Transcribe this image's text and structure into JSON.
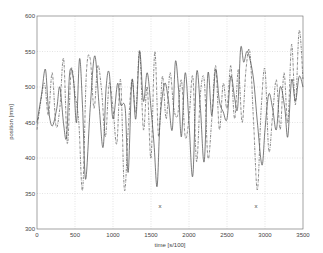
{
  "chart_data": {
    "type": "line",
    "title": "",
    "xlabel": "time [s/100]",
    "ylabel": "position [mm]",
    "xlim": [
      0,
      3500
    ],
    "ylim": [
      300,
      600
    ],
    "xticks": [
      0,
      500,
      1000,
      1500,
      2000,
      2500,
      3000,
      3500
    ],
    "yticks": [
      300,
      350,
      400,
      450,
      500,
      550,
      600
    ],
    "grid": true,
    "legend": null,
    "series": [
      {
        "name": "solid",
        "style": "solid",
        "color": "#444444",
        "x": [
          0,
          60,
          110,
          150,
          200,
          260,
          300,
          350,
          390,
          430,
          480,
          520,
          560,
          600,
          640,
          700,
          760,
          820,
          870,
          910,
          950,
          1000,
          1060,
          1100,
          1160,
          1200,
          1250,
          1300,
          1350,
          1400,
          1450,
          1500,
          1540,
          1580,
          1620,
          1680,
          1730,
          1780,
          1820,
          1860,
          1900,
          1950,
          2000,
          2050,
          2100,
          2150,
          2200,
          2250,
          2300,
          2350,
          2400,
          2450,
          2500,
          2550,
          2600,
          2640,
          2680,
          2720,
          2760,
          2800,
          2850,
          2900,
          2960,
          3000,
          3050,
          3100,
          3150,
          3200,
          3260,
          3300,
          3350,
          3400,
          3450,
          3500
        ],
        "y": [
          450,
          490,
          525,
          470,
          445,
          470,
          500,
          448,
          430,
          520,
          510,
          450,
          540,
          470,
          370,
          470,
          544,
          470,
          415,
          500,
          520,
          455,
          505,
          475,
          470,
          380,
          510,
          455,
          550,
          480,
          520,
          470,
          420,
          360,
          455,
          505,
          480,
          440,
          535,
          500,
          430,
          520,
          450,
          375,
          520,
          470,
          395,
          520,
          460,
          525,
          480,
          465,
          455,
          515,
          485,
          470,
          555,
          535,
          550,
          540,
          510,
          450,
          390,
          440,
          490,
          470,
          440,
          500,
          470,
          430,
          510,
          480,
          515,
          500
        ]
      },
      {
        "name": "dash-dot",
        "style": "dashdot",
        "color": "#555555",
        "x": [
          0,
          50,
          100,
          150,
          200,
          250,
          300,
          350,
          400,
          450,
          500,
          550,
          600,
          650,
          700,
          750,
          800,
          850,
          900,
          950,
          1000,
          1050,
          1100,
          1150,
          1200,
          1250,
          1300,
          1350,
          1400,
          1450,
          1500,
          1550,
          1600,
          1650,
          1700,
          1750,
          1800,
          1850,
          1900,
          1950,
          2000,
          2050,
          2100,
          2150,
          2200,
          2250,
          2300,
          2350,
          2400,
          2450,
          2500,
          2550,
          2600,
          2650,
          2700,
          2750,
          2800,
          2850,
          2900,
          2950,
          3000,
          3050,
          3100,
          3150,
          3200,
          3250,
          3300,
          3350,
          3400,
          3450,
          3500
        ],
        "y": [
          440,
          480,
          505,
          460,
          520,
          445,
          470,
          540,
          420,
          525,
          490,
          450,
          355,
          520,
          540,
          470,
          530,
          495,
          430,
          505,
          470,
          420,
          510,
          355,
          440,
          510,
          465,
          552,
          440,
          500,
          400,
          550,
          430,
          515,
          455,
          520,
          470,
          460,
          510,
          430,
          455,
          515,
          395,
          490,
          510,
          400,
          455,
          530,
          440,
          505,
          470,
          530,
          455,
          525,
          450,
          525,
          550,
          450,
          355,
          470,
          525,
          410,
          460,
          510,
          440,
          520,
          450,
          560,
          475,
          580,
          510
        ]
      }
    ],
    "annotations": [
      {
        "text": "x",
        "x": 1620,
        "y": 332
      },
      {
        "text": "x",
        "x": 2880,
        "y": 332
      }
    ]
  }
}
